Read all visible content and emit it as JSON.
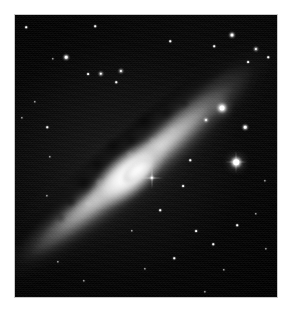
{
  "figure": {
    "kind": "astronomical-image",
    "caption": "",
    "background_color": "#ffffff",
    "plate_color": "#000000",
    "plate_border_color": "#c9c9c9",
    "plate": {
      "x": 15,
      "y": 15,
      "width": 262,
      "height": 282
    }
  },
  "galaxy": {
    "name": "",
    "morphology": "edge-on spiral with prominent dust lane",
    "position_angle_deg": -40,
    "core": {
      "x": 131,
      "y": 167,
      "peak_color": "#ffffff"
    },
    "disk": {
      "length_px": 330,
      "thickness_px": 60
    },
    "dust_lane_color": "#000000",
    "halo_color": "#808080"
  },
  "stars": [
    {
      "x": 222,
      "y": 108,
      "size": 5.0,
      "class": "big",
      "spikes": false
    },
    {
      "x": 236,
      "y": 162,
      "size": 5.5,
      "class": "big",
      "spikes": true
    },
    {
      "x": 245,
      "y": 127,
      "size": 2.6,
      "class": "med",
      "spikes": false
    },
    {
      "x": 206,
      "y": 120,
      "size": 2.0,
      "class": "med",
      "spikes": false
    },
    {
      "x": 232,
      "y": 35,
      "size": 3.0,
      "class": "med",
      "spikes": false
    },
    {
      "x": 256,
      "y": 49,
      "size": 2.2,
      "class": "med",
      "spikes": false
    },
    {
      "x": 248,
      "y": 62,
      "size": 1.8,
      "class": "sml",
      "spikes": false
    },
    {
      "x": 268,
      "y": 57,
      "size": 1.5,
      "class": "sml",
      "spikes": false
    },
    {
      "x": 214,
      "y": 46,
      "size": 1.6,
      "class": "sml",
      "spikes": false
    },
    {
      "x": 170,
      "y": 41,
      "size": 1.5,
      "class": "sml",
      "spikes": false
    },
    {
      "x": 66,
      "y": 57,
      "size": 2.6,
      "class": "med",
      "spikes": false
    },
    {
      "x": 53,
      "y": 59,
      "size": 1.4,
      "class": "sml",
      "spikes": false
    },
    {
      "x": 88,
      "y": 74,
      "size": 1.8,
      "class": "sml",
      "spikes": false
    },
    {
      "x": 101,
      "y": 74,
      "size": 2.4,
      "class": "med",
      "spikes": false
    },
    {
      "x": 121,
      "y": 71,
      "size": 2.2,
      "class": "med",
      "spikes": false
    },
    {
      "x": 116,
      "y": 82,
      "size": 1.5,
      "class": "sml",
      "spikes": false
    },
    {
      "x": 95,
      "y": 26,
      "size": 1.6,
      "class": "sml",
      "spikes": false
    },
    {
      "x": 26,
      "y": 27,
      "size": 1.6,
      "class": "sml",
      "spikes": false
    },
    {
      "x": 35,
      "y": 102,
      "size": 1.4,
      "class": "sml",
      "spikes": false
    },
    {
      "x": 47,
      "y": 127,
      "size": 1.5,
      "class": "sml",
      "spikes": false
    },
    {
      "x": 22,
      "y": 118,
      "size": 1.3,
      "class": "sml",
      "spikes": false
    },
    {
      "x": 50,
      "y": 157,
      "size": 1.4,
      "class": "sml",
      "spikes": false
    },
    {
      "x": 47,
      "y": 196,
      "size": 1.3,
      "class": "sml",
      "spikes": false
    },
    {
      "x": 152,
      "y": 178,
      "size": 2.4,
      "class": "med",
      "spikes": true
    },
    {
      "x": 183,
      "y": 186,
      "size": 1.8,
      "class": "sml",
      "spikes": false
    },
    {
      "x": 160,
      "y": 210,
      "size": 1.6,
      "class": "sml",
      "spikes": false
    },
    {
      "x": 196,
      "y": 231,
      "size": 1.8,
      "class": "sml",
      "spikes": false
    },
    {
      "x": 213,
      "y": 244,
      "size": 1.5,
      "class": "sml",
      "spikes": false
    },
    {
      "x": 237,
      "y": 225,
      "size": 1.6,
      "class": "sml",
      "spikes": false
    },
    {
      "x": 256,
      "y": 214,
      "size": 1.4,
      "class": "sml",
      "spikes": false
    },
    {
      "x": 266,
      "y": 249,
      "size": 1.3,
      "class": "sml",
      "spikes": false
    },
    {
      "x": 174,
      "y": 258,
      "size": 1.5,
      "class": "sml",
      "spikes": false
    },
    {
      "x": 224,
      "y": 270,
      "size": 1.4,
      "class": "sml",
      "spikes": false
    },
    {
      "x": 145,
      "y": 269,
      "size": 1.3,
      "class": "sml",
      "spikes": false
    },
    {
      "x": 84,
      "y": 281,
      "size": 1.4,
      "class": "sml",
      "spikes": false
    },
    {
      "x": 58,
      "y": 262,
      "size": 1.3,
      "class": "sml",
      "spikes": false
    },
    {
      "x": 205,
      "y": 292,
      "size": 1.3,
      "class": "sml",
      "spikes": false
    },
    {
      "x": 265,
      "y": 181,
      "size": 1.3,
      "class": "sml",
      "spikes": false
    },
    {
      "x": 190,
      "y": 160,
      "size": 1.5,
      "class": "sml",
      "spikes": false
    },
    {
      "x": 132,
      "y": 231,
      "size": 1.4,
      "class": "sml",
      "spikes": false
    }
  ]
}
